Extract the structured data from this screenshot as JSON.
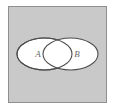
{
  "figure": {
    "name": "venn-diagram",
    "colors": {
      "universe_fill": "#c9c9c9",
      "universe_stroke": "#8f8f8f",
      "set_fill": "#ffffff",
      "set_stroke": "#4d4d4d",
      "label_color": "#6a6a6a",
      "page_background": "#ffffff"
    }
  },
  "universe": {
    "label": "",
    "x": 8,
    "y": 6,
    "width": 99,
    "height": 97
  },
  "sets": [
    {
      "id": "set-a",
      "label": "A",
      "cx": 44.5,
      "cy": 54,
      "rx": 27.5,
      "ry": 16,
      "label_x": 38,
      "label_y": 54
    },
    {
      "id": "set-b",
      "label": "B",
      "cx": 70.5,
      "cy": 54,
      "rx": 27.5,
      "ry": 16,
      "label_x": 77,
      "label_y": 54
    }
  ],
  "intersection": {
    "id": "set-intersection",
    "label": ""
  }
}
